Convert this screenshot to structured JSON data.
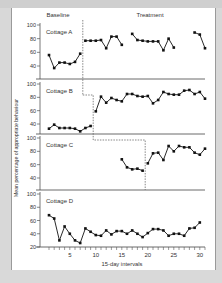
{
  "chart_data": {
    "type": "line",
    "title": "",
    "xlabel": "15-day intervals",
    "ylabel": "Mean percentage of appropriate behaviour",
    "phase_labels": [
      "Baseline",
      "Treatment"
    ],
    "x_ticks": [
      5,
      10,
      15,
      20,
      25,
      30
    ],
    "x_range": [
      1,
      31
    ],
    "panels": [
      {
        "name": "Cottage A",
        "y_ticks": [
          40,
          60,
          80,
          100
        ],
        "ylim": [
          20,
          100
        ],
        "phase_change_after": 7.5,
        "segments": [
          {
            "x": [
              1,
              2,
              3,
              4,
              5,
              6,
              7
            ],
            "y": [
              56,
              37,
              45,
              45,
              43,
              46,
              58
            ]
          },
          {
            "x": [
              8,
              9,
              10,
              11,
              12,
              13,
              14,
              15
            ],
            "y": [
              77,
              77,
              77,
              78,
              66,
              83,
              83,
              71
            ]
          },
          {
            "x": [
              17,
              18,
              19,
              20,
              21,
              22,
              23,
              24,
              25
            ],
            "y": [
              87,
              78,
              77,
              76,
              76,
              76,
              63,
              80,
              67
            ]
          },
          {
            "x": [
              29,
              30,
              31
            ],
            "y": [
              89,
              86,
              66
            ]
          }
        ]
      },
      {
        "name": "Cottage B",
        "y_ticks": [
          40,
          60,
          80,
          100
        ],
        "ylim": [
          20,
          100
        ],
        "phase_change_after": 9.5,
        "segments": [
          {
            "x": [
              1,
              2,
              3,
              4,
              5,
              6,
              7,
              8,
              9
            ],
            "y": [
              33,
              39,
              34,
              34,
              34,
              33,
              29,
              34,
              37
            ]
          },
          {
            "x": [
              10,
              11,
              12,
              13,
              14,
              15,
              16,
              17,
              18,
              19,
              20,
              21,
              22,
              23,
              24,
              25,
              26,
              27,
              28,
              29,
              30,
              31
            ],
            "y": [
              59,
              81,
              72,
              79,
              76,
              74,
              85,
              85,
              82,
              81,
              82,
              71,
              76,
              88,
              85,
              84,
              84,
              90,
              91,
              85,
              88,
              78
            ]
          }
        ]
      },
      {
        "name": "Cottage C",
        "y_ticks": [
          40,
          60,
          80,
          100
        ],
        "ylim": [
          20,
          100
        ],
        "phase_change_after": 19.5,
        "segments": [
          {
            "x": [
              15,
              16,
              17,
              18,
              19
            ],
            "y": [
              68,
              56,
              53,
              54,
              51
            ]
          },
          {
            "x": [
              20,
              21,
              22,
              23,
              24,
              25,
              26,
              27,
              28,
              29,
              30,
              31
            ],
            "y": [
              62,
              77,
              78,
              67,
              88,
              80,
              88,
              86,
              86,
              78,
              75,
              84
            ]
          }
        ]
      },
      {
        "name": "Cottage D",
        "y_ticks": [
          20,
          40,
          60,
          80,
          100
        ],
        "ylim": [
          20,
          100
        ],
        "phase_change_after": null,
        "segments": [
          {
            "x": [
              1,
              2,
              3,
              4,
              5,
              6,
              7,
              8,
              9,
              10,
              11,
              12,
              13,
              14,
              15,
              16,
              17,
              18,
              19,
              20,
              21,
              22,
              23,
              24,
              25,
              26,
              27,
              28,
              29,
              30
            ],
            "y": [
              68,
              63,
              30,
              51,
              40,
              30,
              26,
              48,
              43,
              38,
              37,
              45,
              39,
              44,
              44,
              40,
              45,
              40,
              35,
              41,
              47,
              47,
              45,
              37,
              40,
              40,
              37,
              48,
              49,
              57
            ]
          }
        ]
      }
    ]
  },
  "labels": {
    "baseline": "Baseline",
    "treatment": "Treatment",
    "xlabel": "15-day intervals",
    "ylabel": "Mean percentage of appropriate behaviour"
  }
}
